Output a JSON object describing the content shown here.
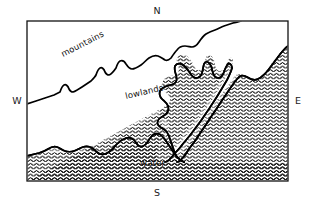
{
  "figure": {
    "name": "physical-region-map",
    "kind": "schematic-map",
    "background_color": "#ffffff",
    "line_color": "#111111"
  },
  "compass": {
    "north": "N",
    "south": "S",
    "east": "E",
    "west": "W"
  },
  "regions": [
    {
      "id": "mountains",
      "label": "mountains",
      "fill": "blank",
      "rotation_deg": -27
    },
    {
      "id": "lowlands",
      "label": "lowlands",
      "fill": "blank",
      "rotation_deg": -13
    },
    {
      "id": "water",
      "label": "water",
      "fill": "wavy-hatch",
      "rotation_deg": 0
    }
  ],
  "labels": {
    "mountains": "mountains",
    "lowlands": "lowlands",
    "water": "water"
  },
  "frame": {
    "x": 27,
    "y": 21,
    "width": 261,
    "height": 160
  }
}
